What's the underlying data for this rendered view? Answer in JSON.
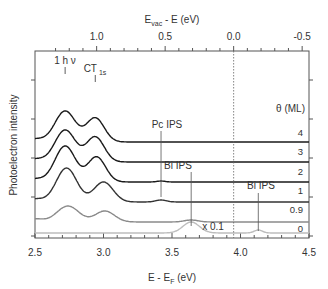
{
  "chart_data": {
    "type": "line",
    "title": "",
    "xlabel": "E - E_F (eV)",
    "xlabel_main": "E - E",
    "xlabel_sub": "F",
    "xlabel_unit": " (eV)",
    "x2label_main": "E",
    "x2label_sub": "vac",
    "x2label_unit": " - E (eV)",
    "ylabel": "Photoelectron intensity",
    "xlim": [
      2.5,
      4.5
    ],
    "xticks": [
      2.5,
      3.0,
      3.5,
      4.0,
      4.5
    ],
    "xtick_labels": [
      "2.5",
      "3.0",
      "3.5",
      "4.0",
      "4.5"
    ],
    "x2_offset": 3.95,
    "x2ticks": [
      1.0,
      0.5,
      0.0,
      -0.5
    ],
    "x2tick_labels": [
      "1.0",
      "0.5",
      "0.0",
      "-0.5"
    ],
    "vacuum_level_E": 3.95,
    "legend_title": "θ (ML)",
    "peak_labels": {
      "one_hv": {
        "text": "1 h ν",
        "x": 2.72
      },
      "ct": {
        "text": "CT",
        "sub": "1s",
        "x": 2.94
      }
    },
    "annotations": [
      {
        "text": "Pc IPS",
        "x": 3.42
      },
      {
        "text": "Bi IPS",
        "x": 3.64
      },
      {
        "text": "Bi IPS",
        "x": 4.13
      },
      {
        "text": "x 0.1"
      }
    ],
    "series": [
      {
        "name": "4",
        "color": "#1a1a1a",
        "baseline": 4.6,
        "peaks": [
          [
            2.72,
            1.55,
            0.075
          ],
          [
            2.94,
            1.2,
            0.065
          ]
        ],
        "ips": []
      },
      {
        "name": "3",
        "color": "#1a1a1a",
        "baseline": 3.6,
        "peaks": [
          [
            2.72,
            1.6,
            0.075
          ],
          [
            2.94,
            1.25,
            0.065
          ]
        ],
        "ips": []
      },
      {
        "name": "2",
        "color": "#1a1a1a",
        "baseline": 2.6,
        "peaks": [
          [
            2.72,
            1.8,
            0.075
          ],
          [
            2.95,
            1.25,
            0.065
          ]
        ],
        "ips": [
          [
            3.42,
            0.05,
            0.03
          ]
        ]
      },
      {
        "name": "1",
        "color": "#333333",
        "baseline": 1.6,
        "peaks": [
          [
            2.73,
            1.7,
            0.075
          ],
          [
            3.0,
            1.0,
            0.07
          ]
        ],
        "ips": [
          [
            3.42,
            0.1,
            0.04
          ]
        ]
      },
      {
        "name": "0.9",
        "color": "#8a8a8a",
        "baseline": 0.6,
        "peaks": [
          [
            2.74,
            0.8,
            0.08
          ],
          [
            3.01,
            0.55,
            0.07
          ]
        ],
        "ips": [
          [
            3.64,
            0.1,
            0.05
          ]
        ]
      },
      {
        "name": "0",
        "color": "#bdbdbd",
        "baseline": 0.05,
        "peaks": [],
        "ips": [
          [
            3.64,
            0.55,
            0.06
          ],
          [
            4.13,
            0.15,
            0.03
          ]
        ]
      }
    ]
  }
}
